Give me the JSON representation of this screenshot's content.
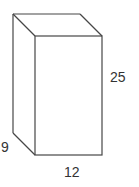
{
  "diagram": {
    "shape": "rectangular-prism",
    "labels": {
      "height": "25",
      "width": "12",
      "depth": "9"
    },
    "colors": {
      "edge": "#474747",
      "text": "#333333",
      "background": "#ffffff"
    }
  }
}
